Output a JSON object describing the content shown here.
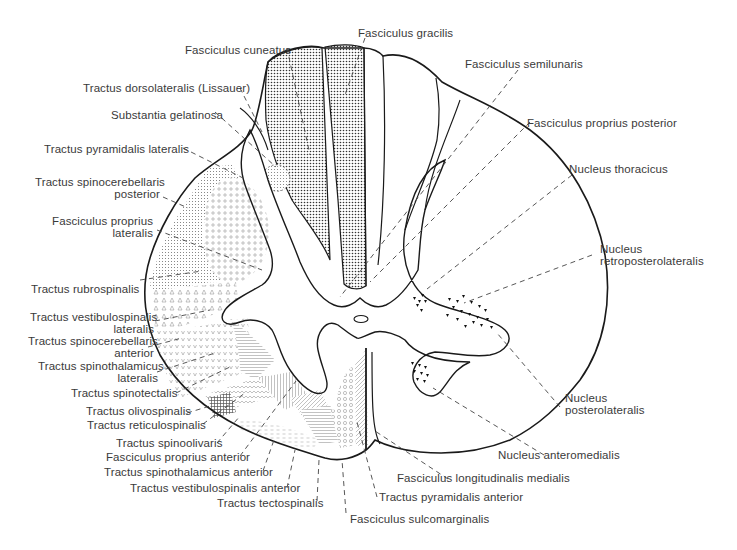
{
  "figure": {
    "labels": {
      "fasciculus_gracilis": "Fasciculus gracilis",
      "fasciculus_cuneatus": "Fasciculus cuneatus",
      "fasciculus_semilunaris": "Fasciculus semilunaris",
      "tractus_dorsolateralis": "Tractus dorsolateralis (Lissauer)",
      "substantia_gelatinosa": "Substantia gelatinosa",
      "fasciculus_proprius_posterior": "Fasciculus proprius posterior",
      "tractus_pyramidalis_lateralis": "Tractus pyramidalis lateralis",
      "nucleus_thoracicus": "Nucleus thoracicus",
      "tractus_spinocerebellaris_posterior_1": "Tractus spinocerebellaris",
      "tractus_spinocerebellaris_posterior_2": "posterior",
      "fasciculus_proprius_lateralis_1": "Fasciculus proprius",
      "fasciculus_proprius_lateralis_2": "lateralis",
      "nucleus_retroposterolateralis_1": "Nucleus",
      "nucleus_retroposterolateralis_2": "retroposterolateralis",
      "tractus_rubrospinalis": "Tractus rubrospinalis",
      "tractus_vestibulospinalis_lateralis_1": "Tractus vestibulospinalis",
      "tractus_vestibulospinalis_lateralis_2": "lateralis",
      "tractus_spinocerebellaris_anterior_1": "Tractus spinocerebellaris",
      "tractus_spinocerebellaris_anterior_2": "anterior",
      "tractus_spinothalamicus_lateralis_1": "Tractus spinothalamicus",
      "tractus_spinothalamicus_lateralis_2": "lateralis",
      "tractus_spinotectalis": "Tractus spinotectalis",
      "tractus_olivospinalis": "Tractus olivospinalis",
      "tractus_reticulospinalis": "Tractus reticulospinalis",
      "nucleus_posterolateralis_1": "Nucleus",
      "nucleus_posterolateralis_2": "posterolateralis",
      "tractus_spinoolivaris": "Tractus spinoolivaris",
      "fasciculus_proprius_anterior": "Fasciculus proprius anterior",
      "nucleus_anteromedialis": "Nucleus anteromedialis",
      "tractus_spinothalamicus_anterior": "Tractus spinothalamicus anterior",
      "fasciculus_longitudinalis_medialis": "Fasciculus longitudinalis medialis",
      "tractus_vestibulospinalis_anterior": "Tractus vestibulospinalis anterior",
      "tractus_pyramidalis_anterior": "Tractus pyramidalis anterior",
      "tractus_tectospinalis": "Tractus tectospinalis",
      "fasciculus_sulcomarginalis": "Fasciculus sulcomarginalis"
    },
    "colors": {
      "outline": "#1a1a1a",
      "text": "#3a3a3a",
      "leader": "#444444",
      "background": "#ffffff"
    }
  }
}
